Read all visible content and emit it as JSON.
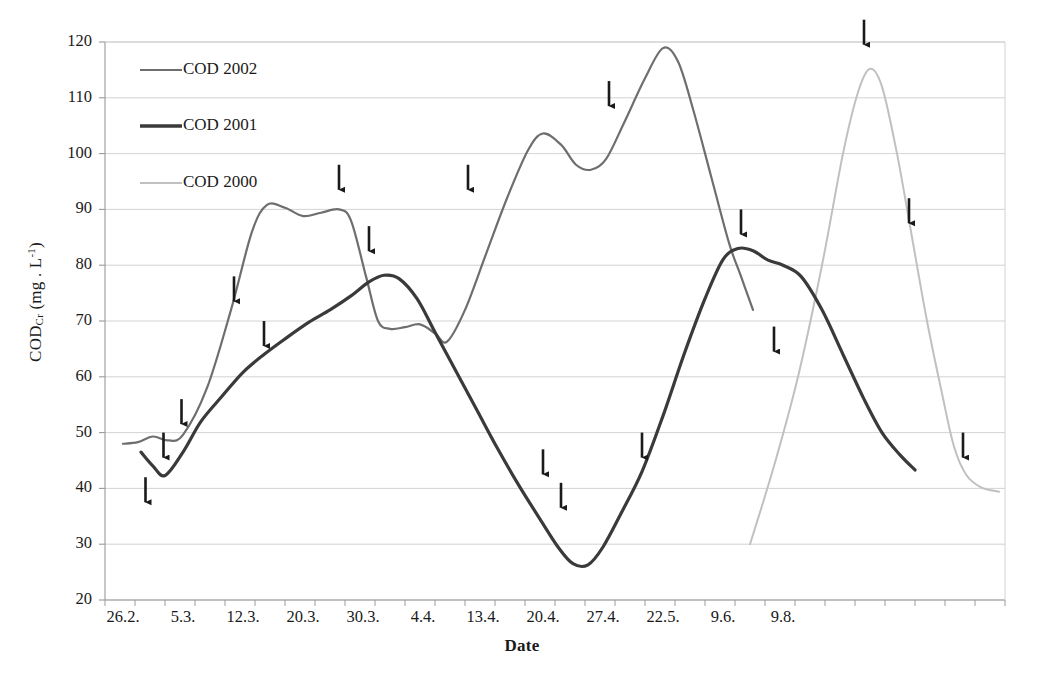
{
  "chart_data": {
    "type": "line",
    "title": "",
    "xlabel": "Date",
    "ylabel": "CODCr (mg . L-1)",
    "ylabel_parts": {
      "base": "COD",
      "sub": "Cr",
      "unit_open": " (mg . L",
      "sup": "-1",
      "unit_close": ")"
    },
    "ylim": [
      20,
      120
    ],
    "ytick_step": 10,
    "yticks": [
      120,
      110,
      100,
      90,
      80,
      70,
      60,
      50,
      40,
      30,
      20
    ],
    "xticks": [
      "26.2.",
      "5.3.",
      "12.3.",
      "20.3.",
      "30.3.",
      "4.4.",
      "13.4.",
      "20.4.",
      "27.4.",
      "22.5.",
      "9.6.",
      "9.8."
    ],
    "xtick_positions": [
      0.6,
      2.6,
      4.6,
      6.6,
      8.6,
      10.6,
      12.6,
      14.6,
      16.6,
      18.6,
      20.6,
      22.6
    ],
    "grid": true,
    "grid_color": "#c8c8c8",
    "axis_color": "#9a9a9a",
    "legend_position": "top-left-inside",
    "series": [
      {
        "name": "COD 2002",
        "color": "#6e6e6e",
        "width": 2.2,
        "points": [
          [
            0.6,
            48.0
          ],
          [
            1.1,
            48.3
          ],
          [
            1.6,
            49.3
          ],
          [
            2.1,
            48.6
          ],
          [
            2.6,
            49.6
          ],
          [
            3.4,
            58.0
          ],
          [
            4.2,
            72.0
          ],
          [
            4.9,
            86.0
          ],
          [
            5.4,
            90.8
          ],
          [
            6.0,
            90.3
          ],
          [
            6.6,
            88.8
          ],
          [
            7.2,
            89.4
          ],
          [
            7.8,
            90.0
          ],
          [
            8.2,
            88.0
          ],
          [
            8.7,
            78.0
          ],
          [
            9.1,
            70.0
          ],
          [
            9.5,
            68.6
          ],
          [
            10.0,
            68.9
          ],
          [
            10.5,
            69.4
          ],
          [
            11.0,
            67.8
          ],
          [
            11.4,
            66.3
          ],
          [
            12.0,
            72.0
          ],
          [
            12.7,
            82.0
          ],
          [
            13.4,
            92.0
          ],
          [
            14.1,
            100.6
          ],
          [
            14.6,
            103.6
          ],
          [
            15.2,
            101.6
          ],
          [
            15.7,
            98.0
          ],
          [
            16.2,
            97.1
          ],
          [
            16.7,
            99.0
          ],
          [
            17.3,
            105.5
          ],
          [
            18.0,
            113.5
          ],
          [
            18.6,
            118.9
          ],
          [
            19.1,
            116.5
          ],
          [
            19.6,
            108.0
          ],
          [
            20.2,
            96.0
          ],
          [
            20.8,
            84.0
          ],
          [
            21.2,
            78.0
          ],
          [
            21.6,
            72.0
          ]
        ]
      },
      {
        "name": "COD 2001",
        "color": "#3a3a3a",
        "width": 3.2,
        "points": [
          [
            1.2,
            46.5
          ],
          [
            1.6,
            44.0
          ],
          [
            2.0,
            42.3
          ],
          [
            2.6,
            46.5
          ],
          [
            3.2,
            52.0
          ],
          [
            3.9,
            56.5
          ],
          [
            4.6,
            60.8
          ],
          [
            5.3,
            64.0
          ],
          [
            6.0,
            66.8
          ],
          [
            6.8,
            69.8
          ],
          [
            7.5,
            72.0
          ],
          [
            8.2,
            74.5
          ],
          [
            8.8,
            77.0
          ],
          [
            9.3,
            78.2
          ],
          [
            9.8,
            77.6
          ],
          [
            10.4,
            74.0
          ],
          [
            11.0,
            68.0
          ],
          [
            11.7,
            61.0
          ],
          [
            12.4,
            54.0
          ],
          [
            13.1,
            47.0
          ],
          [
            13.8,
            40.5
          ],
          [
            14.5,
            34.5
          ],
          [
            15.1,
            29.5
          ],
          [
            15.6,
            26.5
          ],
          [
            16.1,
            26.3
          ],
          [
            16.6,
            29.5
          ],
          [
            17.2,
            35.5
          ],
          [
            17.9,
            43.0
          ],
          [
            18.6,
            53.0
          ],
          [
            19.3,
            64.0
          ],
          [
            20.0,
            74.0
          ],
          [
            20.6,
            81.0
          ],
          [
            21.1,
            83.0
          ],
          [
            21.6,
            82.6
          ],
          [
            22.1,
            80.9
          ],
          [
            22.6,
            80.0
          ],
          [
            23.2,
            78.0
          ],
          [
            23.9,
            72.0
          ],
          [
            24.6,
            64.0
          ],
          [
            25.3,
            56.0
          ],
          [
            25.9,
            50.0
          ],
          [
            26.5,
            46.0
          ],
          [
            27.0,
            43.3
          ]
        ]
      },
      {
        "name": "COD 2000",
        "color": "#c0c0c0",
        "width": 2.0,
        "points": [
          [
            21.5,
            30.0
          ],
          [
            22.3,
            44.0
          ],
          [
            23.1,
            60.0
          ],
          [
            23.9,
            80.0
          ],
          [
            24.6,
            100.0
          ],
          [
            25.1,
            111.0
          ],
          [
            25.5,
            115.2
          ],
          [
            25.9,
            112.0
          ],
          [
            26.4,
            100.0
          ],
          [
            26.9,
            85.0
          ],
          [
            27.4,
            70.0
          ],
          [
            27.9,
            57.0
          ],
          [
            28.3,
            47.5
          ],
          [
            28.7,
            42.5
          ],
          [
            29.2,
            40.2
          ],
          [
            29.8,
            39.4
          ]
        ]
      }
    ],
    "arrow_markers": [
      {
        "x": 1.35,
        "y_top": 42.0,
        "label": "arrow-1"
      },
      {
        "x": 1.95,
        "y_top": 50.0,
        "label": "arrow-2"
      },
      {
        "x": 2.55,
        "y_top": 56.0,
        "label": "arrow-3"
      },
      {
        "x": 4.3,
        "y_top": 78.0,
        "label": "arrow-4"
      },
      {
        "x": 5.3,
        "y_top": 70.0,
        "label": "arrow-5"
      },
      {
        "x": 7.8,
        "y_top": 98.0,
        "label": "arrow-6"
      },
      {
        "x": 8.8,
        "y_top": 87.0,
        "label": "arrow-7"
      },
      {
        "x": 12.1,
        "y_top": 98.0,
        "label": "arrow-8"
      },
      {
        "x": 14.6,
        "y_top": 47.0,
        "label": "arrow-9"
      },
      {
        "x": 15.2,
        "y_top": 41.0,
        "label": "arrow-10"
      },
      {
        "x": 16.8,
        "y_top": 113.0,
        "label": "arrow-11"
      },
      {
        "x": 17.9,
        "y_top": 50.0,
        "label": "arrow-12"
      },
      {
        "x": 21.2,
        "y_top": 90.0,
        "label": "arrow-13"
      },
      {
        "x": 22.3,
        "y_top": 69.0,
        "label": "arrow-14"
      },
      {
        "x": 25.3,
        "y_top": 124.0,
        "label": "arrow-15"
      },
      {
        "x": 26.8,
        "y_top": 92.0,
        "label": "arrow-16"
      },
      {
        "x": 28.6,
        "y_top": 50.0,
        "label": "arrow-17"
      }
    ]
  },
  "legend": {
    "items": [
      {
        "label": "COD 2002",
        "color": "#6e6e6e",
        "width": 2.2
      },
      {
        "label": "COD 2001",
        "color": "#3a3a3a",
        "width": 3.4
      },
      {
        "label": "COD 2000",
        "color": "#c0c0c0",
        "width": 2.0
      }
    ]
  }
}
